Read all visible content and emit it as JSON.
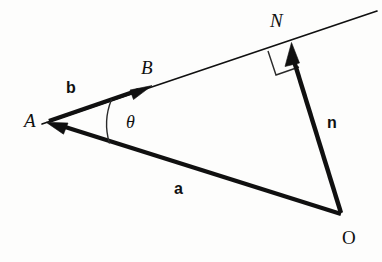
{
  "figure": {
    "background_color": "#fdfdfc",
    "stroke_color": "#101010",
    "thin_stroke_color": "#1a1a1a"
  },
  "points": {
    "A": {
      "label": "A",
      "x": 47,
      "y": 122,
      "label_x": 24,
      "label_y": 113
    },
    "B": {
      "label": "B",
      "x": 148,
      "y": 87,
      "label_x": 141,
      "label_y": 59
    },
    "N": {
      "label": "N",
      "x": 291,
      "y": 44,
      "label_x": 271,
      "label_y": 13
    },
    "O": {
      "label": "O",
      "x": 342,
      "y": 216,
      "label_x": 343,
      "label_y": 230
    }
  },
  "vectors": [
    {
      "name": "b",
      "label": "b",
      "label_x": 66,
      "label_y": 81,
      "from": "A",
      "to": "B",
      "arrow": "end",
      "description": "direction vector along the line from A towards B"
    },
    {
      "name": "a",
      "label": "a",
      "label_x": 174,
      "label_y": 182,
      "from": "O",
      "to": "A",
      "arrow": "end",
      "description": "position vector from O to A"
    },
    {
      "name": "n",
      "label": "n",
      "label_x": 327,
      "label_y": 116,
      "from": "O",
      "to": "N",
      "arrow": "end",
      "description": "perpendicular vector from O to the foot N on the line"
    }
  ],
  "line": {
    "name": "line-through-A-and-B",
    "start_x": 42,
    "start_y": 124,
    "end_x": 377,
    "end_y": 11,
    "description": "infinite straight line passing through A, B and N"
  },
  "angle": {
    "name": "theta",
    "label": "θ",
    "label_x": 126,
    "label_y": 114,
    "at_point": "A",
    "between": [
      "b",
      "a"
    ],
    "description": "angle at A between direction b and vector a"
  },
  "right_angle": {
    "name": "right-angle-marker",
    "at_point": "N",
    "description": "square marker showing n is perpendicular to the line at N"
  }
}
